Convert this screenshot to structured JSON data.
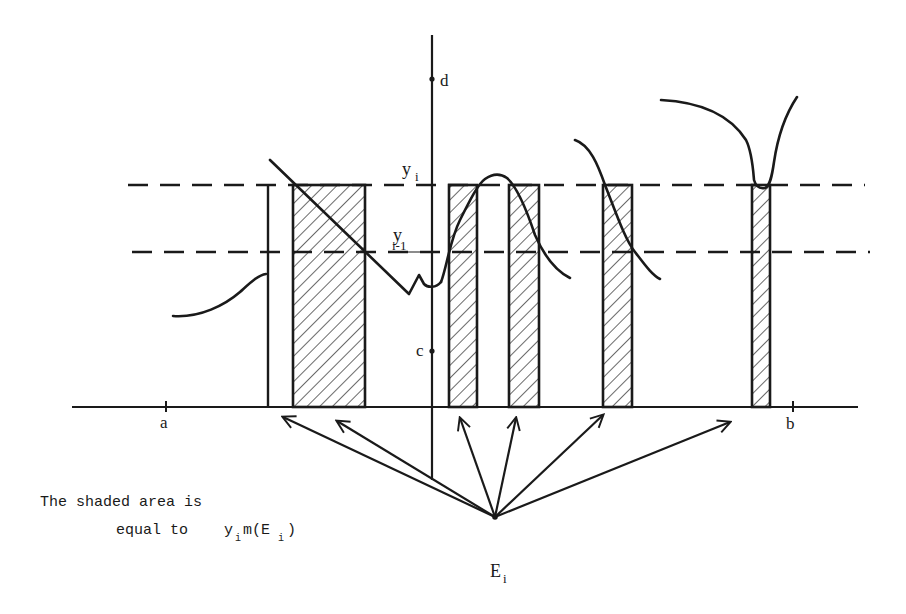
{
  "figure": {
    "axis_labels": {
      "d": "d",
      "c": "c",
      "a": "a",
      "b": "b",
      "yi_main": "y",
      "yi_sub": "i",
      "yi1_main": "y",
      "yi1_sub": "i-1"
    },
    "caption": {
      "line1": "The shaded area is",
      "line2_prefix": "equal to",
      "line2_y": "y",
      "line2_y_sub": "i",
      "line2_m": "m(E",
      "line2_E_sub": "i",
      "line2_close": ")"
    },
    "source_label": {
      "main": "E",
      "sub": "i"
    },
    "levels": [
      {
        "name": "y_i",
        "description": "upper dashed level"
      },
      {
        "name": "y_{i-1}",
        "description": "lower dashed level"
      }
    ],
    "shaded_intervals_count": 5,
    "arrow_count": 6
  }
}
